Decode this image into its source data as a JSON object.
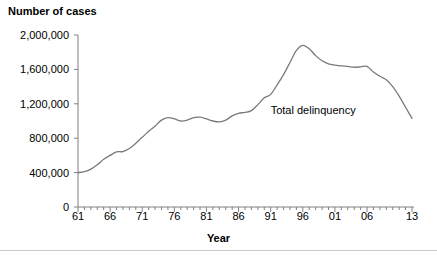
{
  "chart_data": {
    "type": "line",
    "title": "",
    "ylabel": "Number of cases",
    "xlabel": "Year",
    "ylim": [
      0,
      2000000
    ],
    "xlim": [
      1961,
      2013
    ],
    "grid": false,
    "legend_position": "inline-annotation",
    "y_ticks": [
      0,
      400000,
      800000,
      1200000,
      1600000,
      2000000
    ],
    "y_tick_labels": [
      "0",
      "400,000",
      "800,000",
      "1,200,000",
      "1,600,000",
      "2,000,000"
    ],
    "x_ticks": [
      1961,
      1966,
      1971,
      1976,
      1981,
      1986,
      1991,
      1996,
      2001,
      2006,
      2013
    ],
    "x_tick_labels": [
      "61",
      "66",
      "71",
      "76",
      "81",
      "86",
      "91",
      "96",
      "01",
      "06",
      "13"
    ],
    "x_minor_tick_interval": 1,
    "annotations": [
      {
        "text": "Total delinquency",
        "x": 1991,
        "y": 1120000
      }
    ],
    "series": [
      {
        "name": "Total delinquency",
        "color": "#7a7a7a",
        "x": [
          1961,
          1962,
          1963,
          1964,
          1965,
          1966,
          1967,
          1968,
          1969,
          1970,
          1971,
          1972,
          1973,
          1974,
          1975,
          1976,
          1977,
          1978,
          1979,
          1980,
          1981,
          1982,
          1983,
          1984,
          1985,
          1986,
          1987,
          1988,
          1989,
          1990,
          1991,
          1992,
          1993,
          1994,
          1995,
          1996,
          1997,
          1998,
          1999,
          2000,
          2001,
          2002,
          2003,
          2004,
          2005,
          2006,
          2007,
          2008,
          2009,
          2010,
          2011,
          2012,
          2013
        ],
        "values": [
          400000,
          410000,
          440000,
          490000,
          555000,
          600000,
          640000,
          645000,
          680000,
          740000,
          810000,
          880000,
          940000,
          1010000,
          1040000,
          1025000,
          1000000,
          1010000,
          1040000,
          1045000,
          1025000,
          1000000,
          990000,
          1010000,
          1060000,
          1090000,
          1100000,
          1120000,
          1190000,
          1270000,
          1310000,
          1420000,
          1540000,
          1680000,
          1820000,
          1880000,
          1840000,
          1760000,
          1700000,
          1665000,
          1650000,
          1640000,
          1635000,
          1625000,
          1630000,
          1635000,
          1570000,
          1520000,
          1480000,
          1400000,
          1290000,
          1160000,
          1030000
        ]
      }
    ]
  }
}
